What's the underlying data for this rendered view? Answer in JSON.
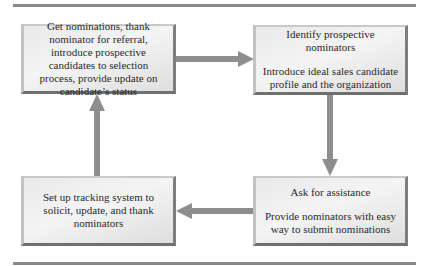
{
  "diagram": {
    "type": "cycle-flow",
    "colors": {
      "box_fill": "#ececec",
      "box_shadow": "#707070",
      "arrow": "#8e8e8e",
      "rule": "#8a8a8a"
    },
    "boxes": [
      {
        "id": "box-get-nominations",
        "lines": [
          "Get nominations, thank nominator for referral, introduce prospective candidates to selection process, provide update on candidate’s status"
        ]
      },
      {
        "id": "box-identify",
        "lines": [
          "Identify prospective nominators",
          "Introduce ideal sales candidate profile and the organization"
        ]
      },
      {
        "id": "box-ask",
        "lines": [
          "Ask for assistance",
          "Provide nominators with easy way to submit nominations"
        ]
      },
      {
        "id": "box-tracking",
        "lines": [
          "Set up tracking system to solicit, update, and thank nominators"
        ]
      }
    ],
    "arrows": [
      {
        "from": "box-get-nominations",
        "to": "box-identify",
        "direction": "right"
      },
      {
        "from": "box-identify",
        "to": "box-ask",
        "direction": "down"
      },
      {
        "from": "box-ask",
        "to": "box-tracking",
        "direction": "left"
      },
      {
        "from": "box-tracking",
        "to": "box-get-nominations",
        "direction": "up"
      }
    ]
  }
}
